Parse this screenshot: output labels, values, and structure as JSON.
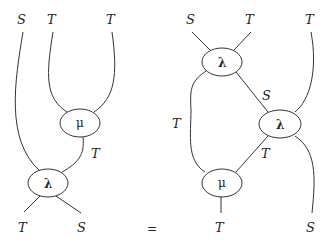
{
  "diagram": {
    "equation_sign": "=",
    "left": {
      "top_labels": [
        "S",
        "T",
        "T"
      ],
      "bottom_labels": [
        "T",
        "S"
      ],
      "wire_labels": [
        "T"
      ],
      "nodes": [
        {
          "id": "mu",
          "label": "μ"
        },
        {
          "id": "lambda",
          "label": "λ"
        }
      ]
    },
    "right": {
      "top_labels": [
        "S",
        "T",
        "T"
      ],
      "bottom_labels": [
        "T",
        "S"
      ],
      "wire_labels": [
        "S",
        "T",
        "T"
      ],
      "nodes": [
        {
          "id": "lambda_top",
          "label": "λ"
        },
        {
          "id": "lambda_right",
          "label": "λ"
        },
        {
          "id": "mu",
          "label": "μ"
        }
      ]
    }
  }
}
